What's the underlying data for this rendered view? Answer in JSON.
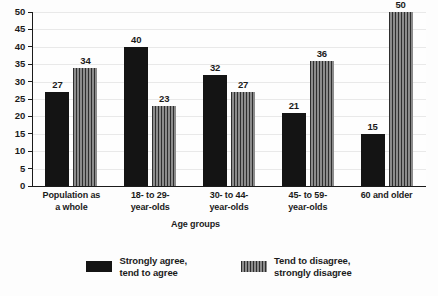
{
  "chart_data": {
    "type": "bar",
    "title": "",
    "subtitle": "",
    "xlabel": "Age groups",
    "ylabel": "",
    "categories": [
      "Population as\na whole",
      "18- to 29-\nyear-olds",
      "30- to 44-\nyear-olds",
      "45- to 59-\nyear-olds",
      "60 and older"
    ],
    "series": [
      {
        "name": "Strongly agree,\ntend to agree",
        "values": [
          27,
          40,
          32,
          21,
          15
        ],
        "color": "#141414",
        "fill": "solid"
      },
      {
        "name": "Tend to disagree,\nstrongly disagree",
        "values": [
          34,
          23,
          27,
          36,
          50
        ],
        "color": "#6d6d6d",
        "fill": "vertical-stripes"
      }
    ],
    "ylim": [
      0,
      50
    ],
    "y_ticks": [
      0,
      5,
      10,
      15,
      20,
      25,
      30,
      35,
      40,
      45,
      50
    ],
    "grid": true,
    "grid_axis": "y",
    "legend_position": "bottom",
    "data_labels": true
  },
  "axes": {
    "y_tick_labels": [
      "0",
      "5",
      "10",
      "15",
      "20",
      "25",
      "30",
      "35",
      "40",
      "45",
      "50"
    ],
    "x_axis_title": "Age groups"
  },
  "legend": {
    "items": [
      {
        "label": "Strongly agree,\ntend to agree"
      },
      {
        "label": "Tend to disagree,\nstrongly disagree"
      }
    ]
  },
  "colors": {
    "series0": "#141414",
    "series1": "#6d6d6d",
    "axis": "#1b1b1b",
    "grid": "#e9e9e9",
    "background": "#fdfdfd"
  }
}
